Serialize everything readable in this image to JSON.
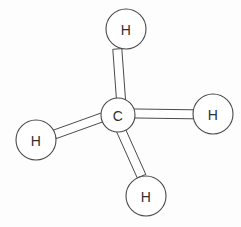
{
  "figure": {
    "molecule_name": "Methane",
    "formula": "CH4",
    "background_color": "#fdfdfd",
    "stroke_color": "#4a4a4a",
    "fill_color": "#ffffff",
    "label_color": "#303030",
    "style": "line drawing ball-and-stick"
  },
  "atoms": [
    {
      "id": "carbon-center",
      "label": "C",
      "element": "carbon",
      "cx": 118,
      "cy": 115,
      "r": 17
    },
    {
      "id": "hydrogen-top",
      "label": "H",
      "element": "hydrogen",
      "cx": 126,
      "cy": 29,
      "r": 20
    },
    {
      "id": "hydrogen-right",
      "label": "H",
      "element": "hydrogen",
      "cx": 213,
      "cy": 114,
      "r": 20
    },
    {
      "id": "hydrogen-left",
      "label": "H",
      "element": "hydrogen",
      "cx": 36,
      "cy": 140,
      "r": 20
    },
    {
      "id": "hydrogen-bottom",
      "label": "H",
      "element": "hydrogen",
      "cx": 146,
      "cy": 196,
      "r": 20
    }
  ],
  "bonds": [
    {
      "id": "bond-c-h-top",
      "from": "carbon-center",
      "to": "hydrogen-top",
      "order": 1,
      "width": 9,
      "points": "117.3,111 112.8,49.3 121.8,48.6 126.3,110.4"
    },
    {
      "id": "bond-c-h-right",
      "from": "carbon-center",
      "to": "hydrogen-right",
      "order": 1,
      "width": 9,
      "points": "122,108.8 193.5,109.8 193.5,118.8 122,117.8"
    },
    {
      "id": "bond-c-h-left",
      "from": "carbon-center",
      "to": "hydrogen-left",
      "order": 1,
      "width": 9,
      "points": "102.5,112.5 53.2,130.2 56.2,138.6 105.5,120.9"
    },
    {
      "id": "bond-c-h-bottom",
      "from": "carbon-center",
      "to": "hydrogen-bottom",
      "order": 1,
      "width": 9,
      "points": "116,130.5 137.2,177.8 145.8,174.4 124.6,127.1"
    }
  ]
}
